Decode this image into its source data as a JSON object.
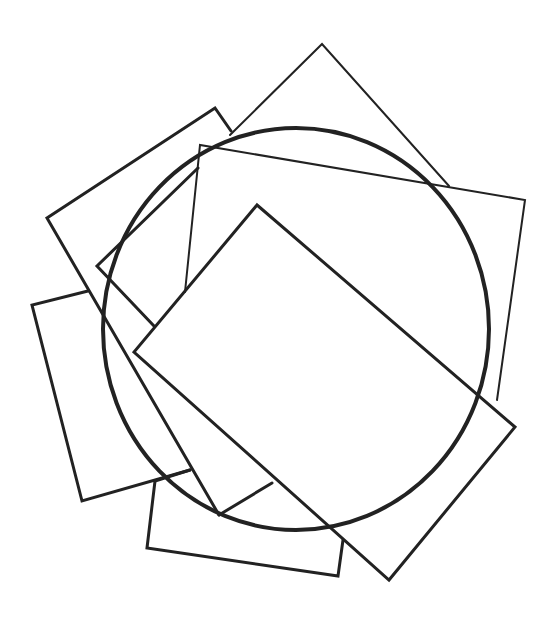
{
  "figure": {
    "stroke_color": "#222222",
    "background": "#ffffff",
    "circle": {
      "cx": 296,
      "cy": 329,
      "rx": 193,
      "ry": 201
    },
    "shapes": [
      {
        "name": "front-rectangle",
        "points": [
          [
            257,
            205
          ],
          [
            515,
            427
          ],
          [
            389,
            580
          ],
          [
            134,
            352
          ]
        ]
      },
      {
        "name": "top-diamond",
        "points": [
          [
            322,
            44
          ],
          [
            449,
            186
          ]
        ]
      },
      {
        "name": "top-right-rectangle",
        "points": [
          [
            200,
            145
          ],
          [
            525,
            200
          ],
          [
            497,
            400
          ]
        ]
      },
      {
        "name": "left-rectangle",
        "points": [
          [
            47,
            218
          ],
          [
            215,
            108
          ],
          [
            230,
            131
          ]
        ]
      },
      {
        "name": "bottom-left-rectangle",
        "points": [
          [
            32,
            305
          ],
          [
            82,
            501
          ],
          [
            190,
            470
          ]
        ]
      },
      {
        "name": "bottom-rectangle",
        "points": [
          [
            155,
            480
          ],
          [
            147,
            548
          ],
          [
            338,
            576
          ]
        ]
      }
    ]
  }
}
